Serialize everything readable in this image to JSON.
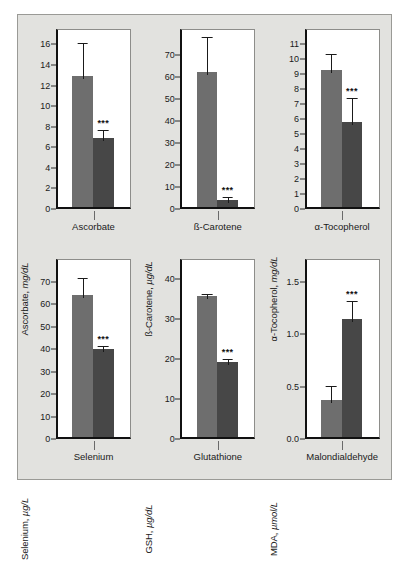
{
  "figure": {
    "background_color": "#e2e2df",
    "series_colors": [
      "#6e6e6e",
      "#474747"
    ],
    "significance_marker": "***"
  },
  "chart_data": [
    {
      "type": "bar",
      "title": "Ascorbate",
      "ylabel_text": "Ascorbate, ",
      "ylabel_unit": "mg/dL",
      "xlabel": "Ascorbate",
      "categories": [
        "Ascorbate"
      ],
      "ylim": [
        0,
        17.5
      ],
      "yticks": [
        0,
        2,
        4,
        6,
        8,
        10,
        12,
        14,
        16
      ],
      "ytick_labels": [
        "0",
        "2",
        "4",
        "6",
        "8",
        "10",
        "12",
        "14",
        "16"
      ],
      "grid": false,
      "series": [
        {
          "name": "Group 1",
          "value": 12.7,
          "error_high": 16.2,
          "significance": ""
        },
        {
          "name": "Group 2",
          "value": 6.7,
          "error_high": 7.8,
          "significance": "***"
        }
      ]
    },
    {
      "type": "bar",
      "title": "ß-Carotene",
      "ylabel_text": "ß-Carotene, ",
      "ylabel_unit": "µg/dL",
      "xlabel": "ß-Carotene",
      "categories": [
        "ß-Carotene"
      ],
      "ylim": [
        0,
        82
      ],
      "yticks": [
        0,
        10,
        20,
        30,
        40,
        50,
        60,
        70
      ],
      "ytick_labels": [
        "0",
        "10",
        "20",
        "30",
        "40",
        "50",
        "60",
        "70"
      ],
      "grid": false,
      "series": [
        {
          "name": "Group 1",
          "value": 61.5,
          "error_high": 79.0,
          "significance": ""
        },
        {
          "name": "Group 2",
          "value": 3.0,
          "error_high": 6.0,
          "significance": "***"
        }
      ]
    },
    {
      "type": "bar",
      "title": "α-Tocopherol",
      "ylabel_text": "α-Tocopherol, ",
      "ylabel_unit": "mg/dL",
      "xlabel": "α-Tocopherol",
      "categories": [
        "α-Tocopherol"
      ],
      "ylim": [
        0,
        12.0
      ],
      "yticks": [
        0,
        1,
        2,
        3,
        4,
        5,
        6,
        7,
        8,
        9,
        10,
        11
      ],
      "ytick_labels": [
        "0",
        "1",
        "2",
        "3",
        "4",
        "5",
        "6",
        "7",
        "8",
        "9",
        "10",
        "11"
      ],
      "grid": false,
      "series": [
        {
          "name": "Group 1",
          "value": 9.15,
          "error_high": 10.4,
          "significance": ""
        },
        {
          "name": "Group 2",
          "value": 5.7,
          "error_high": 7.5,
          "significance": "***"
        }
      ]
    },
    {
      "type": "bar",
      "title": "Selenium",
      "ylabel_text": "Selenium, ",
      "ylabel_unit": "µg/L",
      "xlabel": "Selenium",
      "categories": [
        "Selenium"
      ],
      "ylim": [
        0,
        80
      ],
      "yticks": [
        0,
        10,
        20,
        30,
        40,
        50,
        60,
        70
      ],
      "ytick_labels": [
        "0",
        "10",
        "20",
        "30",
        "40",
        "50",
        "60",
        "70"
      ],
      "grid": false,
      "series": [
        {
          "name": "Group 1",
          "value": 63.0,
          "error_high": 72.0,
          "significance": ""
        },
        {
          "name": "Group 2",
          "value": 39.0,
          "error_high": 42.0,
          "significance": "***"
        }
      ]
    },
    {
      "type": "bar",
      "title": "Glutathione",
      "ylabel_text": "GSH, ",
      "ylabel_unit": "µg/dL",
      "xlabel": "Glutathione",
      "categories": [
        "Glutathione"
      ],
      "ylim": [
        0,
        45
      ],
      "yticks": [
        0,
        10,
        20,
        30,
        40
      ],
      "ytick_labels": [
        "0",
        "10",
        "20",
        "30",
        "40"
      ],
      "grid": false,
      "series": [
        {
          "name": "Group 1",
          "value": 35.3,
          "error_high": 36.6,
          "significance": ""
        },
        {
          "name": "Group 2",
          "value": 18.8,
          "error_high": 20.3,
          "significance": "***"
        }
      ]
    },
    {
      "type": "bar",
      "title": "Malondialdehyde",
      "ylabel_text": "MDA, ",
      "ylabel_unit": "µmol/L",
      "xlabel": "Malondialdehyde",
      "categories": [
        "Malondialdehyde"
      ],
      "ylim": [
        0,
        1.72
      ],
      "yticks": [
        0.0,
        0.5,
        1.0,
        1.5
      ],
      "ytick_labels": [
        "0.0",
        "0.5",
        "1.0",
        "1.5"
      ],
      "grid": false,
      "series": [
        {
          "name": "Group 1",
          "value": 0.35,
          "error_high": 0.52,
          "significance": ""
        },
        {
          "name": "Group 2",
          "value": 1.13,
          "error_high": 1.33,
          "significance": "***"
        }
      ]
    }
  ]
}
